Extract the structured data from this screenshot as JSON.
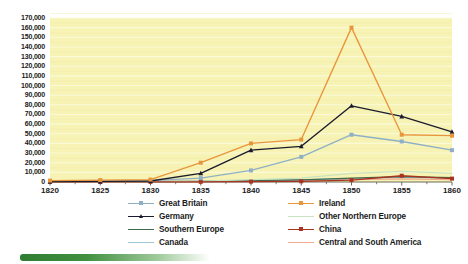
{
  "chart_data": {
    "type": "line",
    "title": "",
    "xlabel": "",
    "ylabel": "",
    "x": [
      1820,
      1825,
      1830,
      1835,
      1840,
      1845,
      1850,
      1855,
      1860
    ],
    "categories": [
      "1820",
      "1825",
      "1830",
      "1835",
      "1840",
      "1845",
      "1850",
      "1855",
      "1860"
    ],
    "ylim": [
      0,
      170000
    ],
    "xlim": [
      1820,
      1860
    ],
    "grid": true,
    "legend_position": "bottom",
    "plot_background": "#f7f3b4",
    "y_ticks": [
      "0",
      "10,000",
      "20,000",
      "30,000",
      "40,000",
      "50,000",
      "60,000",
      "70,000",
      "80,000",
      "90,000",
      "100,000",
      "110,000",
      "120,000",
      "130,000",
      "140,000",
      "150,000",
      "160,000",
      "170,000"
    ],
    "y_tick_values": [
      0,
      10000,
      20000,
      30000,
      40000,
      50000,
      60000,
      70000,
      80000,
      90000,
      100000,
      110000,
      120000,
      130000,
      140000,
      150000,
      160000,
      170000
    ],
    "series": [
      {
        "name": "Great Britain",
        "color": "#8fb0c4",
        "marker": "square",
        "values": [
          1000,
          1200,
          1500,
          4000,
          12000,
          26000,
          49000,
          42000,
          33000
        ]
      },
      {
        "name": "Ireland",
        "color": "#e8963c",
        "marker": "square",
        "values": [
          1500,
          2000,
          2500,
          20000,
          40000,
          44000,
          160000,
          49000,
          48000
        ]
      },
      {
        "name": "Germany",
        "color": "#1b1b2e",
        "marker": "triangle",
        "values": [
          500,
          600,
          1000,
          9000,
          33000,
          37000,
          79000,
          68000,
          52000
        ]
      },
      {
        "name": "Other Northern Europe",
        "color": "#c9e3c0",
        "marker": "none",
        "values": [
          200,
          250,
          300,
          900,
          2500,
          4000,
          9000,
          11000,
          9000
        ]
      },
      {
        "name": "Southern Europe",
        "color": "#3f6b4c",
        "marker": "none",
        "values": [
          150,
          200,
          250,
          600,
          1500,
          2200,
          4000,
          5500,
          4500
        ]
      },
      {
        "name": "China",
        "color": "#a8331f",
        "marker": "square",
        "values": [
          100,
          120,
          150,
          200,
          400,
          700,
          2000,
          6500,
          3500
        ]
      },
      {
        "name": "Canada",
        "color": "#9fc4d4",
        "marker": "none",
        "values": [
          300,
          350,
          400,
          800,
          1600,
          2200,
          3500,
          5000,
          4000
        ]
      },
      {
        "name": "Central and South America",
        "color": "#f0a98c",
        "marker": "none",
        "values": [
          200,
          220,
          260,
          500,
          1100,
          1600,
          2600,
          3200,
          2600
        ]
      }
    ]
  }
}
